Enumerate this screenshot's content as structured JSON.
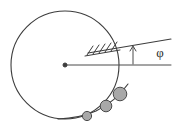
{
  "figure": {
    "background_color": "#ffffff",
    "line_color": "#3d3d3d",
    "ball_fill_color": "#a8a8a8",
    "ball_stroke_color": "#4a4a4a",
    "width": 179,
    "height": 133
  },
  "labels": {
    "angle_symbol": "φ"
  },
  "geometry": {
    "circle": {
      "center_x": 65,
      "center_y": 65,
      "radius": 54
    },
    "center_dot": {
      "x": 65,
      "y": 65,
      "radius": 2
    },
    "horizontal_line": {
      "x1": 65,
      "y1": 65,
      "x2": 171,
      "y2": 65
    },
    "inclined_line": {
      "x1": 88,
      "y1": 53,
      "x2": 171,
      "y2": 39
    },
    "angle_arrow": {
      "x": 133,
      "y_base": 64,
      "y_tip": 47
    },
    "angle_label_pos": {
      "x": 160,
      "y": 57
    },
    "hatch_marks": [
      {
        "x1": 87,
        "y1": 55,
        "x2": 93,
        "y2": 46
      },
      {
        "x1": 93,
        "y1": 54,
        "x2": 99,
        "y2": 45
      },
      {
        "x1": 99,
        "y1": 53,
        "x2": 105,
        "y2": 44
      },
      {
        "x1": 105,
        "y1": 52,
        "x2": 111,
        "y2": 43
      },
      {
        "x1": 111,
        "y1": 51,
        "x2": 117,
        "y2": 42
      }
    ],
    "ball_path": {
      "d": "M 58 119 L 87 116 L 105 106 L 121 94 L 133 76"
    },
    "balls": [
      {
        "cx": 87,
        "cy": 116,
        "r": 4.6,
        "order": 1
      },
      {
        "cx": 106,
        "cy": 106,
        "r": 5.8,
        "order": 2
      },
      {
        "cx": 120,
        "cy": 94,
        "r": 6.8,
        "order": 3
      }
    ]
  }
}
